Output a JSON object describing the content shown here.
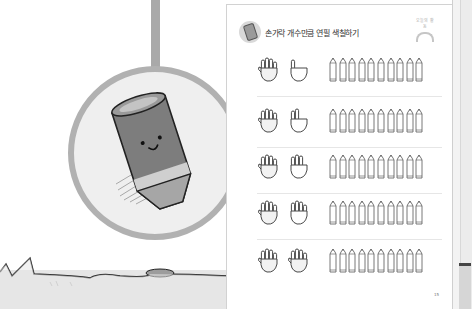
{
  "scene": {
    "description": "Children's workbook page photographed open with illustration of a pencil character on left",
    "illustration": {
      "subject": "pencil-character-in-circle",
      "colors": {
        "circle_border": "#b1b1b1",
        "circle_fill": "#efefef",
        "rod": "#a9a9a9",
        "ground": "#e6e6e6"
      }
    }
  },
  "worksheet": {
    "title": "손가락 개수만큼 연필 색칠하기",
    "corner_label": "오늘의 활동",
    "page_number": "15",
    "rows": [
      {
        "left_hand": "five-fingers",
        "right_hand": "one-finger",
        "total": 6,
        "pencil_count": 10
      },
      {
        "left_hand": "five-fingers",
        "right_hand": "two-fingers",
        "total": 7,
        "pencil_count": 10
      },
      {
        "left_hand": "five-fingers",
        "right_hand": "three-fingers",
        "total": 8,
        "pencil_count": 10
      },
      {
        "left_hand": "five-fingers",
        "right_hand": "four-fingers",
        "total": 9,
        "pencil_count": 10
      },
      {
        "left_hand": "five-fingers",
        "right_hand": "five-fingers",
        "total": 10,
        "pencil_count": 10
      }
    ]
  }
}
